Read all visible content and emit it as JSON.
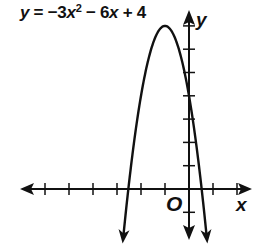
{
  "equation": {
    "lhs": "y",
    "eq": "=",
    "t1": "−3",
    "t1var": "x",
    "t1exp": "2",
    "t2": "− 6",
    "t2var": "x",
    "t3": "+ 4"
  },
  "axes": {
    "x_label": "x",
    "y_label": "y",
    "origin_label": "O"
  },
  "colors": {
    "ink": "#111111",
    "background": "#ffffff"
  },
  "chart_data": {
    "type": "line",
    "xlabel": "x",
    "ylabel": "y",
    "function": "y = -3x^2 - 6x + 4",
    "xlim": [
      -6.5,
      2.5
    ],
    "ylim": [
      -2,
      7.5
    ],
    "x_ticks": [
      -6,
      -5,
      -4,
      -3,
      -2,
      -1,
      1,
      2
    ],
    "y_ticks": [
      -1,
      1,
      2,
      3,
      4,
      5,
      6,
      7
    ],
    "tick_labels_shown": false,
    "grid": false,
    "legend": "none",
    "vertex": [
      -1,
      7
    ],
    "y_intercept": 4,
    "x_intercepts": [
      -2.53,
      0.53
    ],
    "series": [
      {
        "name": "y = -3x^2 - 6x + 4",
        "x": [
          -2.73,
          -2.5,
          -2,
          -1.5,
          -1,
          -0.5,
          0,
          0.5,
          0.73
        ],
        "y": [
          -2,
          0.25,
          4,
          6.25,
          7,
          6.25,
          4,
          0.25,
          -2
        ]
      }
    ],
    "annotations": [
      "O (origin)"
    ]
  }
}
